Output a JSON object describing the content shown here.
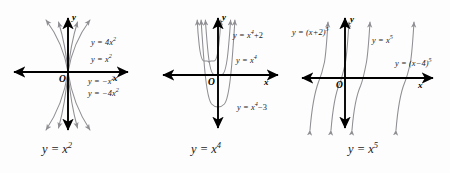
{
  "figure": {
    "background_color": "#fdfdfd",
    "curve_color": "#8e8e93",
    "axis_color": "#000000",
    "text_color": "#1a1a1a"
  },
  "panels": [
    {
      "id": "quadratic",
      "caption": "y = x",
      "caption_exp": "2",
      "axis_x_label": "x",
      "axis_y_label": "y",
      "origin_label": "O",
      "curves": [
        {
          "label_prefix": "y = 4x",
          "label_exp": "2",
          "name": "y-equals-4x-squared"
        },
        {
          "label_prefix": "y = x",
          "label_exp": "2",
          "name": "y-equals-x-squared"
        },
        {
          "label_prefix": "y = −x",
          "label_exp": "2",
          "name": "y-equals-negative-x-squared"
        },
        {
          "label_prefix": "y = −4x",
          "label_exp": "2",
          "name": "y-equals-negative-4x-squared"
        }
      ]
    },
    {
      "id": "quartic",
      "caption": "y = x",
      "caption_exp": "4",
      "axis_x_label": "x",
      "axis_y_label": "y",
      "origin_label": "O",
      "curves": [
        {
          "label_prefix": "y = x",
          "label_exp": "4",
          "label_suffix": "+2",
          "name": "y-equals-x-fourth-plus-2"
        },
        {
          "label_prefix": "y = x",
          "label_exp": "4",
          "label_suffix": "",
          "name": "y-equals-x-fourth"
        },
        {
          "label_prefix": "y = x",
          "label_exp": "4",
          "label_suffix": "−3",
          "name": "y-equals-x-fourth-minus-3"
        }
      ]
    },
    {
      "id": "quintic",
      "caption": "y = x",
      "caption_exp": "5",
      "axis_x_label": "x",
      "axis_y_label": "y",
      "origin_label": "O",
      "curves": [
        {
          "label_prefix": "y = (x+2)",
          "label_exp": "5",
          "name": "y-equals-x-plus-2-fifth"
        },
        {
          "label_prefix": "y = x",
          "label_exp": "5",
          "name": "y-equals-x-fifth"
        },
        {
          "label_prefix": "y = (x−4)",
          "label_exp": "5",
          "name": "y-equals-x-minus-4-fifth"
        }
      ]
    }
  ]
}
